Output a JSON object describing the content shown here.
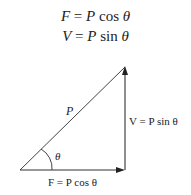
{
  "equations": [
    {
      "lhs": "F",
      "eq": " = ",
      "coef": "P",
      "fn": " cos ",
      "var": "θ"
    },
    {
      "lhs": "V",
      "eq": " = ",
      "coef": "P",
      "fn": " sin ",
      "var": "θ"
    }
  ],
  "diagram": {
    "type": "force-resolution-triangle",
    "vertices": {
      "origin": [
        20,
        170
      ],
      "top": [
        125,
        67
      ],
      "corner": [
        125,
        170
      ]
    },
    "hypotenuse_label": "P",
    "angle_label": "θ",
    "vertical_label": "V = P sin θ",
    "horizontal_label": "F = P cos θ",
    "line_color": "#333333"
  }
}
